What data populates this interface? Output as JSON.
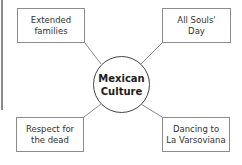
{
  "diagram": {
    "type": "concept-web",
    "center": {
      "label": "Mexican\nCulture"
    },
    "nodes": [
      {
        "id": "top-left",
        "label": "Extended\nfamilies"
      },
      {
        "id": "top-right",
        "label": "All Souls'\nDay"
      },
      {
        "id": "bottom-left",
        "label": "Respect for\nthe dead"
      },
      {
        "id": "bottom-right",
        "label": "Dancing to\nLa Varsoviana"
      }
    ],
    "colors": {
      "box_border": "#8c8c8c",
      "circle_border": "#444444",
      "line": "#8a8a8a"
    }
  }
}
